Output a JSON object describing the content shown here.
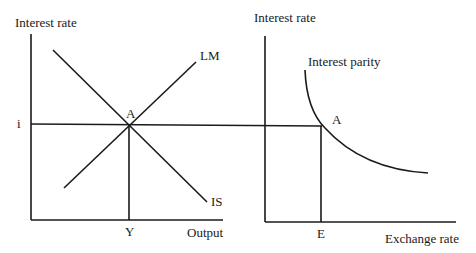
{
  "left_panel": {
    "y_axis_label": "Interest rate",
    "x_axis_label": "Output",
    "curves": [
      {
        "name": "LM",
        "label": "LM"
      },
      {
        "name": "IS",
        "label": "IS"
      }
    ],
    "equilibrium_label": "A",
    "interest_tick": "i",
    "output_tick": "Y"
  },
  "right_panel": {
    "y_axis_label": "Interest rate",
    "x_axis_label": "Exchange rate",
    "curve_label": "Interest parity",
    "equilibrium_label": "A",
    "exchange_tick": "E"
  },
  "colors": {
    "line": "#1a1a1a",
    "background": "#ffffff"
  }
}
